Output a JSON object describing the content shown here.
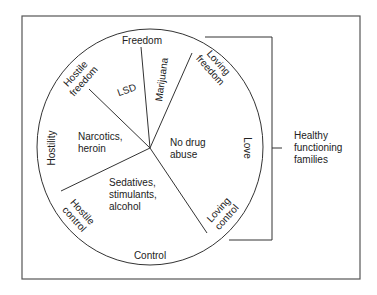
{
  "diagram": {
    "type": "circle-segments",
    "colors": {
      "line": "#333333",
      "text": "#222222",
      "background": "#ffffff"
    },
    "rim_labels": {
      "top": "Freedom",
      "bottom": "Control",
      "left": "Hostility",
      "right": "Love",
      "upper_left": [
        "Hostile",
        "freedom"
      ],
      "lower_left": [
        "Hostile",
        "control"
      ],
      "upper_right": [
        "Loving",
        "freedom"
      ],
      "lower_right": [
        "Loving",
        "control"
      ]
    },
    "segments": {
      "lsd": "LSD",
      "marijuana": "Marijuana",
      "narcotics": [
        "Narcotics,",
        "heroin"
      ],
      "sedatives": [
        "Sedatives,",
        "stimulants,",
        "alcohol"
      ],
      "no_drug": [
        "No drug",
        "abuse"
      ]
    },
    "bracket_label": [
      "Healthy",
      "functioning",
      "families"
    ]
  }
}
